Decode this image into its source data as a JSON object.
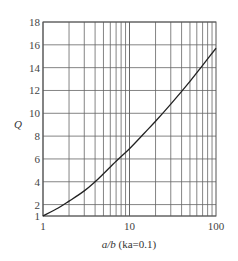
{
  "chart_data": {
    "type": "line",
    "title": "",
    "xlabel": "a/b (ka=0.1)",
    "xlabel_parts": {
      "var": "a/b",
      "paren": "(ka=0.1)"
    },
    "ylabel": "Q",
    "xscale": "log",
    "xlim": [
      1,
      100
    ],
    "ylim": [
      1,
      18
    ],
    "grid": true,
    "legend": null,
    "x_ticks": [
      1,
      10,
      100
    ],
    "x_tick_labels": [
      "1",
      "10",
      "100"
    ],
    "y_ticks": [
      1,
      2,
      4,
      6,
      8,
      10,
      12,
      14,
      16,
      18
    ],
    "y_tick_labels": [
      "1",
      "2",
      "4",
      "6",
      "8",
      "10",
      "12",
      "14",
      "16",
      "18"
    ],
    "series": [
      {
        "name": "Q",
        "x": [
          1,
          1.5,
          2,
          3,
          4,
          5,
          7,
          10,
          15,
          20,
          30,
          50,
          70,
          100
        ],
        "y": [
          1.0,
          1.7,
          2.3,
          3.2,
          4.0,
          4.7,
          5.8,
          6.9,
          8.3,
          9.3,
          10.8,
          12.8,
          14.2,
          15.7
        ]
      }
    ],
    "colors": {
      "line": "#222222",
      "grid": "#666666",
      "text": "#444444"
    }
  }
}
